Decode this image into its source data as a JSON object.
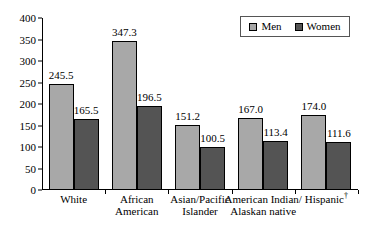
{
  "chart_data": {
    "type": "bar",
    "title": "",
    "subtitle": "",
    "xlabel": "",
    "ylabel": "",
    "ylim": [
      0,
      400
    ],
    "ytick_step": 50,
    "yticks": [
      "0",
      "50",
      "100",
      "150",
      "200",
      "250",
      "300",
      "350",
      "400"
    ],
    "grid": false,
    "legend_position": "top-right",
    "categories": [
      "White",
      "African\nAmerican",
      "Asian/Pacific\nIslander",
      "American Indian/\nAlaskan native",
      "Hispanic"
    ],
    "category_footnote_marks": [
      "",
      "",
      "",
      "",
      "†"
    ],
    "series": [
      {
        "name": "Men",
        "color": "#a8a8a8",
        "values": [
          245.5,
          347.3,
          151.2,
          167.0,
          174.0
        ],
        "labels": [
          "245.5",
          "347.3",
          "151.2",
          "167.0",
          "174.0"
        ]
      },
      {
        "name": "Women",
        "color": "#545454",
        "values": [
          165.5,
          196.5,
          100.5,
          113.4,
          111.6
        ],
        "labels": [
          "165.5",
          "196.5",
          "100.5",
          "113.4",
          "111.6"
        ]
      }
    ]
  },
  "legend": {
    "items": [
      {
        "label": "Men",
        "color": "#a8a8a8"
      },
      {
        "label": "Women",
        "color": "#545454"
      }
    ]
  },
  "colors": {
    "men": "#a8a8a8",
    "women": "#545454",
    "axis": "#000000",
    "background": "#ffffff"
  }
}
